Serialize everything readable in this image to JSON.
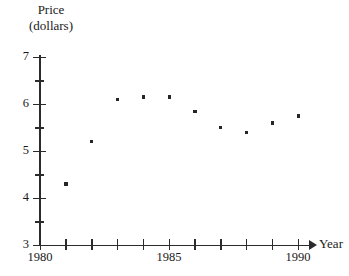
{
  "chart_data": {
    "type": "scatter",
    "title": "",
    "ylabel_line1": "Price",
    "ylabel_line2": "(dollars)",
    "xlabel": "Year",
    "xlim": [
      1980,
      1990.6
    ],
    "ylim": [
      3,
      7
    ],
    "grid": false,
    "legend": false,
    "x": [
      1981,
      1982,
      1983,
      1984,
      1985,
      1986,
      1987,
      1988,
      1989,
      1990
    ],
    "values": [
      4.3,
      5.2,
      6.1,
      6.15,
      6.15,
      5.85,
      5.5,
      5.4,
      5.6,
      5.75
    ],
    "y_ticks_major": [
      3,
      4,
      5,
      6,
      7
    ],
    "y_ticks_minor": [
      3.5,
      4.5,
      5.5,
      6.5
    ],
    "y_tick_labels": [
      "3",
      "4",
      "5",
      "6",
      "7"
    ],
    "x_ticks": [
      1980,
      1981,
      1982,
      1983,
      1984,
      1985,
      1986,
      1987,
      1988,
      1989,
      1990
    ],
    "x_tick_labels_shown": [
      "1980",
      "1985",
      "1990"
    ],
    "marker": "square-dot",
    "marker_color": "#262626",
    "axis_color": "#2b2b2b",
    "background": "#ffffff"
  },
  "axis": {
    "y_title_line1": "Price",
    "y_title_line2": "(dollars)",
    "x_title": "Year",
    "y_labels": {
      "t3": "3",
      "t4": "4",
      "t5": "5",
      "t6": "6",
      "t7": "7"
    },
    "x_labels": {
      "start": "1980",
      "mid": "1985",
      "end": "1990"
    }
  }
}
